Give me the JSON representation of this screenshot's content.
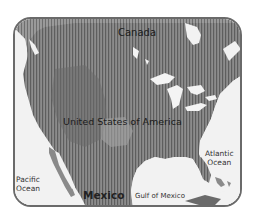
{
  "map": {
    "type": "regional map",
    "region": "North America (United States)",
    "style": "grayscale with vertical hatching over the United States",
    "colors": {
      "land": "#8a8a8a",
      "land_dark": "#6e6e6e",
      "water": "#f2f2f2",
      "hatching": "#5a5a5a",
      "frame": "#6a6a6a"
    },
    "labels": {
      "canada": "Canada",
      "usa": "United States of America",
      "mexico": "Mexico",
      "gulf": "Gulf of Mexico",
      "atlantic_line1": "Atlantic",
      "atlantic_line2": "Ocean",
      "pacific_line1": "Pacific",
      "pacific_line2": "Ocean"
    }
  }
}
